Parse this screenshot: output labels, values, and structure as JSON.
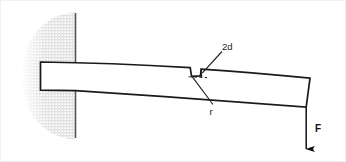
{
  "figure": {
    "width": 346,
    "height": 162,
    "background_color": "#ffffff",
    "border_color": "#f0f0f0"
  },
  "labels": {
    "notch_width": "2d",
    "notch_radius": "r",
    "force": "F"
  },
  "colors": {
    "outline": "#1a1a1a",
    "hatch_fill": "#e2e2e2",
    "wall_line": "#4d4d4d",
    "dashed": "#333333",
    "leader": "#222222"
  },
  "geometry": {
    "support": {
      "wall_x": 75,
      "wall_top_y": 13,
      "wall_bottom_y": 138,
      "ground_shape": "half-ellipse-stipple",
      "ground_center_x": 75,
      "ground_center_y": 76,
      "ground_rx": 52,
      "ground_ry": 64
    },
    "beam": {
      "left_x": 40,
      "top_left_y": 62,
      "bottom_left_y": 90,
      "right_top_x": 310,
      "right_top_y": 78,
      "right_bottom_x": 306,
      "right_bottom_y": 107,
      "curvature": "downward-sagging"
    },
    "notch": {
      "x_start": 190,
      "x_end": 201,
      "depth_y": 76,
      "top_y": 67
    },
    "force_arrow": {
      "x": 306,
      "y_start": 107,
      "y_end": 150,
      "direction": "down",
      "head": "solid-triangle"
    }
  }
}
